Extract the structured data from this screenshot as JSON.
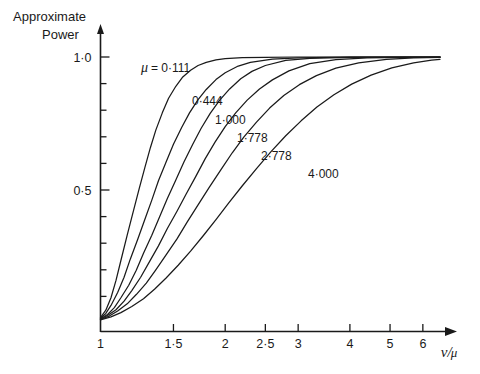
{
  "chart_data": {
    "type": "line",
    "title": "",
    "ylabel_lines": [
      "Approximate",
      "Power"
    ],
    "xlabel": "ν/μ",
    "x_scale": "log",
    "xlim": [
      1,
      6.6
    ],
    "ylim": [
      0,
      1.06
    ],
    "grid": false,
    "legend_position": "inline-curve-labels",
    "x_ticks": [
      {
        "value": 1,
        "label": "1"
      },
      {
        "value": 1.5,
        "label": "1·5"
      },
      {
        "value": 2,
        "label": "2"
      },
      {
        "value": 2.5,
        "label": "2·5"
      },
      {
        "value": 3,
        "label": "3"
      },
      {
        "value": 4,
        "label": "4"
      },
      {
        "value": 5,
        "label": "5"
      },
      {
        "value": 6,
        "label": "6"
      }
    ],
    "y_ticks": [
      {
        "value": 0.1,
        "label": ""
      },
      {
        "value": 0.2,
        "label": ""
      },
      {
        "value": 0.3,
        "label": ""
      },
      {
        "value": 0.4,
        "label": ""
      },
      {
        "value": 0.5,
        "label": "0·5"
      },
      {
        "value": 0.6,
        "label": ""
      },
      {
        "value": 0.7,
        "label": ""
      },
      {
        "value": 0.8,
        "label": ""
      },
      {
        "value": 0.9,
        "label": ""
      },
      {
        "value": 1.0,
        "label": "1·0"
      }
    ],
    "series": [
      {
        "name": "μ = 0·111",
        "label_text": "μ = 0·111",
        "mu": 0.111,
        "x50": 1.335,
        "x": [
          1.0,
          1.03,
          1.06,
          1.09,
          1.12,
          1.16,
          1.2,
          1.24,
          1.28,
          1.32,
          1.36,
          1.41,
          1.46,
          1.52,
          1.58,
          1.65,
          1.72,
          1.8,
          1.9,
          2.0,
          2.2,
          2.5,
          3.0,
          4.0,
          5.0,
          6.6
        ],
        "y": [
          0.02,
          0.048,
          0.095,
          0.16,
          0.235,
          0.33,
          0.42,
          0.505,
          0.585,
          0.66,
          0.725,
          0.79,
          0.845,
          0.89,
          0.925,
          0.95,
          0.968,
          0.98,
          0.989,
          0.994,
          0.998,
          0.999,
          1.0,
          1.0,
          1.0,
          1.0
        ]
      },
      {
        "name": "0·444",
        "label_text": "0·444",
        "mu": 0.444,
        "x50": 1.43,
        "x": [
          1.0,
          1.03,
          1.06,
          1.1,
          1.14,
          1.18,
          1.23,
          1.28,
          1.33,
          1.38,
          1.44,
          1.5,
          1.57,
          1.64,
          1.72,
          1.8,
          1.9,
          2.0,
          2.15,
          2.3,
          2.6,
          3.0,
          4.0,
          5.0,
          6.6
        ],
        "y": [
          0.018,
          0.036,
          0.066,
          0.115,
          0.172,
          0.24,
          0.315,
          0.39,
          0.462,
          0.535,
          0.605,
          0.672,
          0.735,
          0.79,
          0.84,
          0.878,
          0.915,
          0.941,
          0.966,
          0.98,
          0.992,
          0.997,
          1.0,
          1.0,
          1.0
        ]
      },
      {
        "name": "1·000",
        "label_text": "1·000",
        "mu": 1.0,
        "x50": 1.545,
        "x": [
          1.0,
          1.04,
          1.08,
          1.12,
          1.17,
          1.22,
          1.27,
          1.33,
          1.39,
          1.45,
          1.52,
          1.59,
          1.67,
          1.75,
          1.84,
          1.94,
          2.05,
          2.18,
          2.32,
          2.5,
          2.8,
          3.2,
          4.0,
          5.0,
          6.6
        ],
        "y": [
          0.016,
          0.032,
          0.058,
          0.095,
          0.142,
          0.198,
          0.262,
          0.33,
          0.4,
          0.468,
          0.538,
          0.605,
          0.672,
          0.732,
          0.788,
          0.838,
          0.88,
          0.918,
          0.946,
          0.968,
          0.987,
          0.995,
          0.999,
          1.0,
          1.0
        ]
      },
      {
        "name": "1·778",
        "label_text": "1·778",
        "mu": 1.778,
        "x50": 1.69,
        "x": [
          1.0,
          1.04,
          1.09,
          1.14,
          1.19,
          1.25,
          1.31,
          1.38,
          1.45,
          1.53,
          1.61,
          1.7,
          1.79,
          1.89,
          2.0,
          2.12,
          2.26,
          2.42,
          2.6,
          2.85,
          3.2,
          3.7,
          4.4,
          5.4,
          6.6
        ],
        "y": [
          0.014,
          0.028,
          0.05,
          0.082,
          0.122,
          0.172,
          0.228,
          0.29,
          0.355,
          0.42,
          0.485,
          0.552,
          0.618,
          0.68,
          0.738,
          0.79,
          0.838,
          0.88,
          0.914,
          0.948,
          0.975,
          0.99,
          0.997,
          0.999,
          1.0
        ]
      },
      {
        "name": "2·778",
        "label_text": "2·778",
        "mu": 2.778,
        "x50": 1.88,
        "x": [
          1.0,
          1.05,
          1.1,
          1.16,
          1.22,
          1.29,
          1.36,
          1.44,
          1.53,
          1.62,
          1.72,
          1.83,
          1.95,
          2.08,
          2.22,
          2.38,
          2.56,
          2.77,
          3.02,
          3.32,
          3.7,
          4.2,
          4.9,
          5.7,
          6.6
        ],
        "y": [
          0.013,
          0.026,
          0.045,
          0.072,
          0.107,
          0.15,
          0.2,
          0.256,
          0.316,
          0.38,
          0.444,
          0.51,
          0.575,
          0.64,
          0.7,
          0.755,
          0.808,
          0.855,
          0.896,
          0.93,
          0.958,
          0.978,
          0.991,
          0.997,
          0.999
        ]
      },
      {
        "name": "4·000",
        "label_text": "4·000",
        "mu": 4.0,
        "x50": 2.175,
        "x": [
          1.0,
          1.06,
          1.12,
          1.19,
          1.27,
          1.35,
          1.44,
          1.54,
          1.65,
          1.77,
          1.9,
          2.04,
          2.2,
          2.38,
          2.58,
          2.8,
          3.05,
          3.33,
          3.66,
          4.04,
          4.5,
          5.05,
          5.7,
          6.3,
          6.6
        ],
        "y": [
          0.012,
          0.023,
          0.039,
          0.062,
          0.091,
          0.127,
          0.169,
          0.217,
          0.27,
          0.328,
          0.389,
          0.452,
          0.516,
          0.58,
          0.644,
          0.704,
          0.76,
          0.812,
          0.858,
          0.898,
          0.932,
          0.959,
          0.978,
          0.988,
          0.991
        ]
      }
    ],
    "curve_label_positions": [
      {
        "text": "μ = 0·111",
        "px": 141,
        "py": 72
      },
      {
        "text": "0·444",
        "px": 192,
        "py": 105
      },
      {
        "text": "1·000",
        "px": 215,
        "py": 124
      },
      {
        "text": "1·778",
        "px": 237,
        "py": 142
      },
      {
        "text": "2·778",
        "px": 261,
        "py": 160
      },
      {
        "text": "4·000",
        "px": 308,
        "py": 178
      }
    ]
  }
}
